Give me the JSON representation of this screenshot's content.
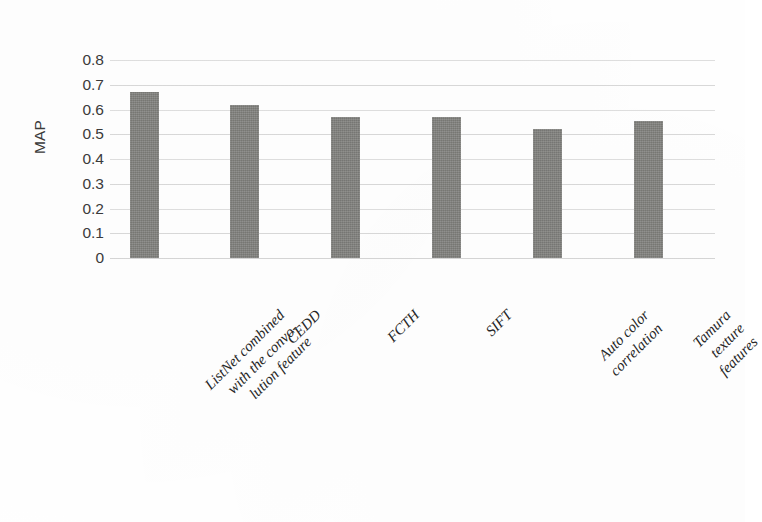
{
  "chart_data": {
    "type": "bar",
    "title": "",
    "xlabel": "",
    "ylabel": "MAP",
    "ylim": [
      0,
      0.8
    ],
    "grid": true,
    "legend": false,
    "bar_color": "#83837f",
    "categories": [
      "ListNet combined with the convo-lution feature",
      "CEDD",
      "FCTH",
      "SIFT",
      "Auto color correlation",
      "Tamura texture features"
    ],
    "category_lines": [
      [
        "ListNet combined",
        "with the convo-",
        "lution feature"
      ],
      [
        "CEDD"
      ],
      [
        "FCTH"
      ],
      [
        "SIFT"
      ],
      [
        "Auto color",
        "correlation"
      ],
      [
        "Tamura",
        "texture",
        "features"
      ]
    ],
    "values": [
      0.67,
      0.62,
      0.57,
      0.57,
      0.52,
      0.555
    ],
    "ytick_labels": [
      "0.8",
      "0.7",
      "0.6",
      "0.5",
      "0.4",
      "0.3",
      "0.2",
      "0.1",
      "0"
    ],
    "ytick_values": [
      0.8,
      0.7,
      0.6,
      0.5,
      0.4,
      0.3,
      0.2,
      0.1,
      0
    ]
  },
  "axis": {
    "y_title": "MAP"
  }
}
